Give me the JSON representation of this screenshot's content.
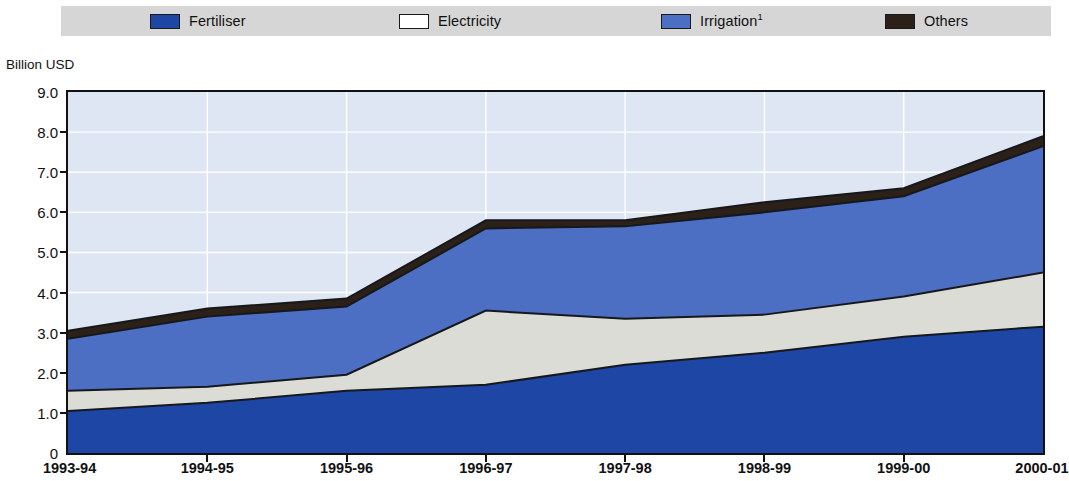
{
  "axis_title": "Billion USD",
  "legend": {
    "items": [
      {
        "label": "Fertiliser",
        "sup": "",
        "color": "#1e46a5",
        "swatch": "legend-swatch-fertiliser",
        "x": 150
      },
      {
        "label": "Electricity",
        "sup": "",
        "color": "#ffffff",
        "swatch": "legend-swatch-electricity",
        "x": 399
      },
      {
        "label": "Irrigation",
        "sup": "1",
        "color": "#4c6fc4",
        "swatch": "legend-swatch-irrigation",
        "x": 661
      },
      {
        "label": "Others",
        "sup": "",
        "color": "#2b2119",
        "swatch": "legend-swatch-others",
        "x": 885
      }
    ]
  },
  "chart_data": {
    "type": "area",
    "title": "",
    "subtitle": "",
    "xlabel": "",
    "ylabel": "Billion USD",
    "ylim": [
      0,
      9.0
    ],
    "ytick_labels": [
      "9.0",
      "8.0",
      "7.0",
      "6.0",
      "5.0",
      "4.0",
      "3.0",
      "2.0",
      "1.0",
      "0"
    ],
    "ytick_values": [
      9.0,
      8.0,
      7.0,
      6.0,
      5.0,
      4.0,
      3.0,
      2.0,
      1.0,
      0
    ],
    "grid": true,
    "grid_color": "#ffffff",
    "plot_background": "#dde6f2",
    "legend_position": "top",
    "stacked": true,
    "categories": [
      "1993-94",
      "1994-95",
      "1995-96",
      "1996-97",
      "1997-98",
      "1998-99",
      "1999-00",
      "2000-01"
    ],
    "series": [
      {
        "name": "Fertiliser",
        "color": "#1e46a5",
        "values": [
          1.05,
          1.25,
          1.55,
          1.7,
          2.2,
          2.5,
          2.9,
          3.15
        ]
      },
      {
        "name": "Electricity",
        "color": "#dcdcd6",
        "values": [
          0.5,
          0.4,
          0.4,
          1.85,
          1.15,
          0.95,
          1.0,
          1.35
        ]
      },
      {
        "name": "Irrigation",
        "color": "#4c6fc4",
        "values": [
          1.3,
          1.75,
          1.7,
          2.05,
          2.3,
          2.55,
          2.5,
          3.15
        ]
      },
      {
        "name": "Others",
        "color": "#2b2119",
        "values": [
          0.2,
          0.2,
          0.2,
          0.2,
          0.15,
          0.25,
          0.2,
          0.25
        ]
      }
    ],
    "cumulative_tops": {
      "Fertiliser": [
        1.05,
        1.25,
        1.55,
        1.7,
        2.2,
        2.5,
        2.9,
        3.15
      ],
      "Electricity": [
        1.55,
        1.65,
        1.95,
        3.55,
        3.35,
        3.45,
        3.9,
        4.5
      ],
      "Irrigation": [
        2.85,
        3.4,
        3.65,
        5.6,
        5.65,
        6.0,
        6.4,
        7.65
      ],
      "Others": [
        3.05,
        3.6,
        3.85,
        5.8,
        5.8,
        6.25,
        6.6,
        7.9
      ]
    },
    "notes": [
      "Irrigation figures carry footnote 1"
    ]
  }
}
